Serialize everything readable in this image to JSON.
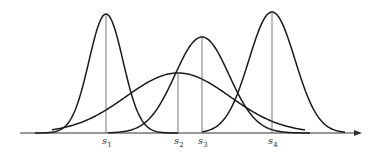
{
  "diagram": {
    "axis": {
      "x_start": 20,
      "x_end": 362,
      "y": 133,
      "arrow": true
    },
    "curves": [
      {
        "name": "s1",
        "mean_x": 106,
        "peak_y": 14,
        "sigma": 17,
        "x_from": 35,
        "x_to": 178
      },
      {
        "name": "s2",
        "mean_x": 178,
        "peak_y": 73,
        "sigma": 52,
        "x_from": 52,
        "x_to": 305
      },
      {
        "name": "s3",
        "mean_x": 202,
        "peak_y": 37,
        "sigma": 27,
        "x_from": 108,
        "x_to": 310
      },
      {
        "name": "s4",
        "mean_x": 272,
        "peak_y": 12,
        "sigma": 23,
        "x_from": 202,
        "x_to": 345
      }
    ],
    "labels": [
      {
        "base": "s",
        "sub": "1",
        "x": 106
      },
      {
        "base": "s",
        "sub": "2",
        "x": 178
      },
      {
        "base": "s",
        "sub": "3",
        "x": 202
      },
      {
        "base": "s",
        "sub": "4",
        "x": 272
      }
    ]
  }
}
